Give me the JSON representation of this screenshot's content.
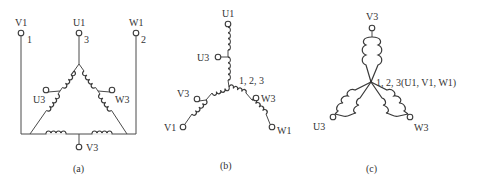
{
  "figure": {
    "panels": [
      {
        "id": "a",
        "caption": "(a)",
        "type": "delta-connection",
        "terminals": {
          "V1": {
            "label": "V1",
            "number": "1"
          },
          "U1": {
            "label": "U1",
            "number": "3"
          },
          "W1": {
            "label": "W1",
            "number": "2"
          },
          "U3": {
            "label": "U3"
          },
          "W3": {
            "label": "W3"
          },
          "V3": {
            "label": "V3"
          }
        }
      },
      {
        "id": "b",
        "caption": "(b)",
        "type": "star-connection",
        "center_label": "1, 2, 3",
        "terminals": {
          "U1": {
            "label": "U1"
          },
          "U3": {
            "label": "U3"
          },
          "V3": {
            "label": "V3"
          },
          "V1": {
            "label": "V1"
          },
          "W3": {
            "label": "W3"
          },
          "W1": {
            "label": "W1"
          }
        }
      },
      {
        "id": "c",
        "caption": "(c)",
        "type": "double-star-connection",
        "center_label": "1, 2, 3(U1, V1, W1)",
        "terminals": {
          "V3": {
            "label": "V3"
          },
          "U3": {
            "label": "U3"
          },
          "W3": {
            "label": "W3"
          }
        }
      }
    ],
    "colors": {
      "line": "#3a3a3a",
      "text": "#333333",
      "background": "#ffffff"
    }
  }
}
